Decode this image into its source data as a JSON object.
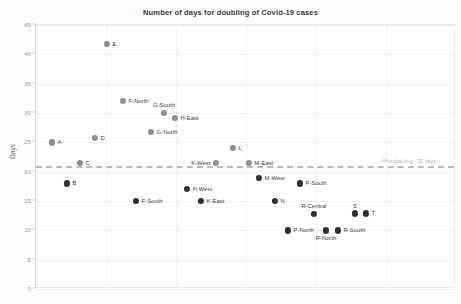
{
  "chart_data": {
    "type": "scatter",
    "title": "Number of days for doubling of Covid-19 cases",
    "xlabel": "",
    "ylabel": "Days",
    "ylim": [
      0,
      45
    ],
    "yticks": [
      0,
      5,
      10,
      15,
      20,
      25,
      30,
      35,
      40,
      45
    ],
    "grid": true,
    "legend": "none",
    "annotations": [
      {
        "name": "mumbai-average-line",
        "label": "Mumbai Avg - 20 days",
        "value": 21,
        "style": "dashed-horizontal",
        "color": "#b9b9bf"
      }
    ],
    "categories": [
      "A",
      "B",
      "C",
      "D",
      "E",
      "F-North",
      "F-South",
      "G-North",
      "G-South",
      "H-East",
      "H-West",
      "K-East",
      "K-West",
      "L",
      "M-East",
      "M-West",
      "N",
      "P-North",
      "P-South",
      "R-Central",
      "R-North",
      "R-South",
      "S",
      "T"
    ],
    "values": [
      25.0,
      18.0,
      21.5,
      25.7,
      41.8,
      32.0,
      15.0,
      26.8,
      30.0,
      29.2,
      17.0,
      15.0,
      21.5,
      24.0,
      21.5,
      19.0,
      15.0,
      10.0,
      18.0,
      12.8,
      10.0,
      10.0,
      12.9,
      12.9
    ],
    "points": [
      {
        "label": "A",
        "value": 25.0,
        "x_px": 51,
        "color": "#8c8c92",
        "label_pos": "right"
      },
      {
        "label": "B",
        "value": 18.0,
        "x_px": 66,
        "color": "#2e2e2e",
        "label_pos": "right"
      },
      {
        "label": "C",
        "value": 21.5,
        "x_px": 79,
        "color": "#8c8c92",
        "label_pos": "right"
      },
      {
        "label": "D",
        "value": 25.7,
        "x_px": 94,
        "color": "#8c8c92",
        "label_pos": "right"
      },
      {
        "label": "E",
        "value": 41.8,
        "x_px": 106,
        "color": "#8c8c92",
        "label_pos": "right"
      },
      {
        "label": "F-North",
        "value": 32.0,
        "x_px": 122,
        "color": "#8c8c92",
        "label_pos": "right"
      },
      {
        "label": "F-South",
        "value": 15.0,
        "x_px": 135,
        "color": "#2e2e2e",
        "label_pos": "right"
      },
      {
        "label": "G-North",
        "value": 26.8,
        "x_px": 150,
        "color": "#8c8c92",
        "label_pos": "right"
      },
      {
        "label": "G-South",
        "value": 30.0,
        "x_px": 163,
        "color": "#8c8c92",
        "label_pos": "above"
      },
      {
        "label": "H-East",
        "value": 29.2,
        "x_px": 174,
        "color": "#8c8c92",
        "label_pos": "right"
      },
      {
        "label": "H-West",
        "value": 17.0,
        "x_px": 186,
        "color": "#2e2e2e",
        "label_pos": "right"
      },
      {
        "label": "K-East",
        "value": 15.0,
        "x_px": 200,
        "color": "#2e2e2e",
        "label_pos": "right"
      },
      {
        "label": "K-West",
        "value": 21.5,
        "x_px": 215,
        "color": "#8c8c92",
        "label_pos": "left"
      },
      {
        "label": "L",
        "value": 24.0,
        "x_px": 232,
        "color": "#8c8c92",
        "label_pos": "right"
      },
      {
        "label": "M-East",
        "value": 21.5,
        "x_px": 248,
        "color": "#8c8c92",
        "label_pos": "right"
      },
      {
        "label": "M-West",
        "value": 19.0,
        "x_px": 258,
        "color": "#2e2e2e",
        "label_pos": "right"
      },
      {
        "label": "N",
        "value": 15.0,
        "x_px": 274,
        "color": "#2e2e2e",
        "label_pos": "right"
      },
      {
        "label": "P-North",
        "value": 10.0,
        "x_px": 287,
        "color": "#2e2e2e",
        "label_pos": "right"
      },
      {
        "label": "P-South",
        "value": 18.0,
        "x_px": 299,
        "color": "#2e2e2e",
        "label_pos": "right"
      },
      {
        "label": "R-Central",
        "value": 12.8,
        "x_px": 313,
        "color": "#2e2e2e",
        "label_pos": "above"
      },
      {
        "label": "R-North",
        "value": 10.0,
        "x_px": 325,
        "color": "#2e2e2e",
        "label_pos": "below"
      },
      {
        "label": "R-South",
        "value": 10.0,
        "x_px": 337,
        "color": "#2e2e2e",
        "label_pos": "right"
      },
      {
        "label": "S",
        "value": 12.9,
        "x_px": 354,
        "color": "#2e2e2e",
        "label_pos": "above"
      },
      {
        "label": "T",
        "value": 12.9,
        "x_px": 365,
        "color": "#2e2e2e",
        "label_pos": "right"
      }
    ]
  }
}
